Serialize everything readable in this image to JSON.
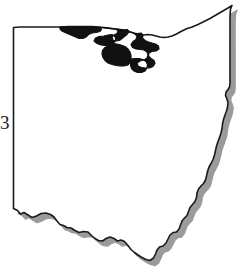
{
  "figure": {
    "label": "3"
  },
  "colors": {
    "background": "#ffffff",
    "outline": "#1a1a1a",
    "highlight_fill": "#111111",
    "shadow": "#9b9b9b",
    "label_text": "#1a1a1a"
  },
  "map": {
    "state_name": "Ohio",
    "outline_stroke_width": 1.6,
    "shadow_offset_x": 5,
    "shadow_offset_y": 5,
    "regions": [
      {
        "name": "northern-highlight-region",
        "fill": "#111111",
        "location": "northern border along Lake Erie"
      }
    ],
    "borders": [
      {
        "name": "west-border",
        "style": "straight vertical line"
      },
      {
        "name": "north-border",
        "style": "Lake Erie shoreline"
      },
      {
        "name": "east-border",
        "style": "Pennsylvania straight line then Ohio River"
      },
      {
        "name": "south-border",
        "style": "Ohio River irregular line"
      }
    ],
    "state_outline_path": "M 13.5,27.5 L 13.5,208.5 L 17.5,210.5 L 20.5,214.0 L 24.0,212.5 L 28.0,215.0 L 32.0,217.5 L 36.5,216.0 L 41.0,213.5 L 46.0,213.0 L 50.5,214.5 L 54.0,217.0 L 57.0,221.0 L 60.0,224.5 L 63.5,225.5 L 67.0,227.5 L 71.0,228.0 L 75.0,230.5 L 79.0,232.5 L 83.5,231.5 L 88.0,232.0 L 91.5,235.5 L 95.0,238.5 L 98.5,240.5 L 102.5,241.0 L 106.0,238.5 L 110.0,237.0 L 114.0,238.5 L 117.5,241.0 L 121.0,240.0 L 124.5,241.5 L 128.0,245.5 L 131.0,249.5 L 134.5,252.5 L 138.0,255.0 L 142.0,257.5 L 146.0,259.5 L 150.0,260.5 L 153.5,258.0 L 155.5,254.0 L 157.0,250.0 L 159.5,247.0 L 163.0,246.0 L 166.0,243.0 L 168.0,239.0 L 170.0,235.0 L 173.0,232.5 L 176.5,232.0 L 179.0,229.0 L 180.5,225.0 L 182.0,221.0 L 184.5,218.0 L 187.0,215.5 L 188.5,211.5 L 190.0,207.5 L 192.5,204.5 L 195.0,201.5 L 196.5,197.5 L 197.0,193.0 L 198.5,189.0 L 201.0,186.0 L 203.5,183.5 L 205.5,180.0 L 206.5,176.0 L 207.5,171.5 L 209.0,167.0 L 211.0,163.5 L 213.0,159.5 L 214.5,155.0 L 215.5,150.5 L 216.5,146.0 L 218.0,141.5 L 219.5,137.5 L 221.0,133.0 L 222.0,128.5 L 222.5,124.0 L 223.5,119.5 L 225.0,115.0 L 226.5,111.0 L 227.5,107.0 L 228.0,103.0 L 227.0,99.0 L 225.5,95.5 L 226.0,92.0 L 228.0,89.5 L 229.5,87.0 L 230.0,83.0 L 230.0,78.0 L 230.0,72.0 L 230.0,64.0 L 230.0,55.0 L 230.0,45.0 L 230.0,35.0 L 230.0,25.0 L 230.0,16.0 L 230.5,9.0 L 232.0,5.5 L 228.0,8.0 L 222.0,11.5 L 216.0,15.0 L 210.0,18.5 L 204.0,21.5 L 198.0,24.5 L 192.0,27.0 L 186.0,29.0 L 181.0,31.5 L 176.5,34.0 L 172.0,36.0 L 168.0,37.0 L 164.0,37.5 L 160.0,37.0 L 156.0,36.0 L 152.0,35.0 L 148.0,34.5 L 144.0,35.0 L 140.0,35.0 L 136.0,34.0 L 132.0,32.5 L 128.0,31.0 L 124.0,30.0 L 120.0,29.5 L 116.0,29.0 L 112.0,28.5 L 108.0,28.0 L 104.0,27.5 L 98.0,27.0 L 92.0,26.5 L 86.0,26.5 L 80.0,26.5 L 74.0,26.5 L 68.0,26.5 L 62.0,27.0 L 56.0,27.0 L 50.0,27.0 L 44.0,27.0 L 38.0,27.0 L 32.0,27.0 L 26.0,27.0 L 20.0,27.0 Z",
    "highlight_region_path": "M 60.0,26.8 L 66.0,26.7 L 72.0,26.7 L 78.0,26.7 L 84.0,26.6 L 90.0,26.6 L 96.0,26.9 L 100.0,27.3 L 101.5,29.5 L 100.0,31.5 L 96.0,32.5 L 92.0,33.0 L 88.5,34.5 L 86.0,37.0 L 83.0,38.5 L 79.0,38.5 L 75.5,37.0 L 72.0,35.5 L 68.5,34.0 L 65.0,32.5 L 62.0,31.0 L 60.0,29.0 Z M 100.0,27.3 L 104.0,27.5 L 108.0,28.0 L 112.0,28.5 L 116.0,29.0 L 118.0,31.0 L 117.0,33.5 L 114.0,35.0 L 112.0,37.5 L 113.0,40.0 L 116.0,41.0 L 119.5,40.5 L 122.0,38.5 L 124.5,36.5 L 127.0,34.5 L 129.0,32.0 L 127.5,29.5 L 124.0,30.0 L 120.0,29.5 L 116.5,29.2 L 112.5,28.8 L 108.5,28.3 L 104.5,27.8 Z M 104.0,36.0 L 108.0,35.0 L 112.0,34.5 L 115.0,36.5 L 116.0,40.5 L 113.0,43.5 L 109.0,45.0 L 105.0,45.5 L 101.0,45.0 L 97.0,43.5 L 94.0,41.0 L 95.5,38.0 L 99.0,36.5 Z M 129.0,32.0 L 132.0,32.5 L 135.0,34.0 L 137.0,36.5 L 136.0,39.5 L 133.0,41.5 L 131.0,44.5 L 132.5,47.5 L 136.0,49.0 L 140.0,49.5 L 144.0,50.0 L 147.0,52.0 L 148.0,55.0 L 147.0,58.0 L 144.0,60.0 L 140.0,61.0 L 137.0,63.0 L 138.0,66.0 L 141.5,67.5 L 145.5,68.0 L 149.5,68.0 L 153.0,66.5 L 155.0,63.5 L 154.0,60.5 L 151.0,58.5 L 148.5,56.0 L 149.0,53.0 L 152.0,51.5 L 156.0,51.0 L 159.0,49.0 L 158.5,46.0 L 155.5,44.0 L 152.0,43.0 L 148.5,42.0 L 145.0,40.5 L 142.5,38.0 L 143.0,35.0 L 141.0,33.0 L 137.5,33.5 L 134.0,33.0 Z M 113.0,43.5 L 117.0,44.0 L 121.0,45.0 L 125.0,46.5 L 128.0,49.0 L 130.0,52.0 L 131.0,55.5 L 131.0,59.0 L 130.0,62.5 L 128.0,65.0 L 124.0,66.0 L 120.0,66.0 L 116.0,65.5 L 112.0,64.5 L 108.0,63.0 L 105.0,60.5 L 103.0,57.5 L 102.0,54.0 L 102.5,50.5 L 105.0,47.5 L 109.0,45.2 Z M 131.0,59.0 L 135.0,58.5 L 139.0,58.5 L 143.0,59.5 L 146.0,61.5 L 147.5,64.5 L 147.0,68.0 L 145.0,71.0 L 141.5,72.5 L 137.5,72.5 L 134.0,71.0 L 131.5,68.5 L 130.5,65.0 Z"
  }
}
